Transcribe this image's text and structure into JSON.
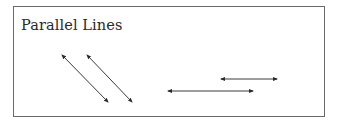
{
  "figure": {
    "title": "Parallel Lines",
    "frame_color": "#6a6a6a",
    "line_color": "#3a3a3a",
    "lines": [
      {
        "name": "diagonal-line-1",
        "x1": 62,
        "y1": 55,
        "x2": 108,
        "y2": 102
      },
      {
        "name": "diagonal-line-2",
        "x1": 87,
        "y1": 55,
        "x2": 132,
        "y2": 102
      },
      {
        "name": "horizontal-line-top",
        "x1": 221,
        "y1": 79,
        "x2": 277,
        "y2": 79
      },
      {
        "name": "horizontal-line-bottom",
        "x1": 168,
        "y1": 91,
        "x2": 253,
        "y2": 91
      }
    ]
  }
}
